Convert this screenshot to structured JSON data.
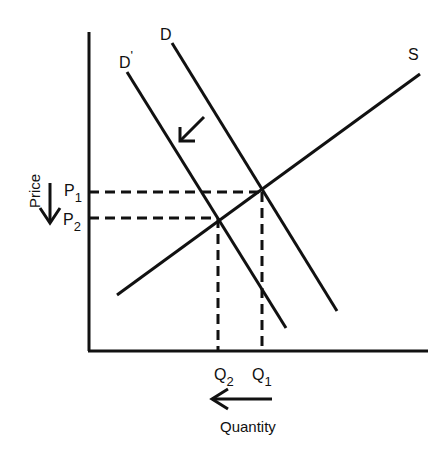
{
  "diagram": {
    "axes": {
      "y_label": "Price",
      "x_label": "Quantity"
    },
    "curves": {
      "supply": "S",
      "demand_original": "D",
      "demand_new": "D",
      "demand_new_prime": "'"
    },
    "price_labels": {
      "p1_main": "P",
      "p1_sub": "1",
      "p2_main": "P",
      "p2_sub": "2"
    },
    "quantity_labels": {
      "q1_main": "Q",
      "q1_sub": "1",
      "q2_main": "Q",
      "q2_sub": "2"
    },
    "annotations": {
      "demand_shift_arrow": "shift left",
      "price_arrow": "price falls",
      "quantity_arrow": "quantity falls"
    },
    "colors": {
      "line": "#111111",
      "background": "#ffffff"
    }
  }
}
